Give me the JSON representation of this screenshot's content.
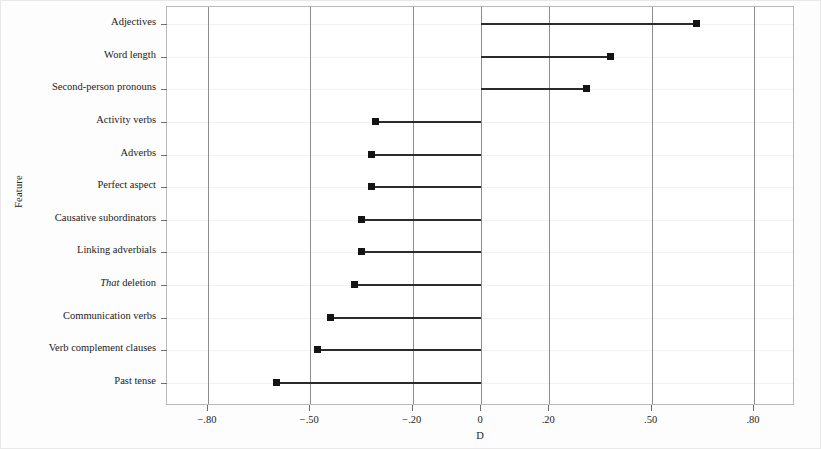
{
  "chart_data": {
    "type": "bar",
    "title": "",
    "subtitle": "",
    "xlabel": "D",
    "ylabel": "Feature",
    "orientation": "horizontal",
    "grid": true,
    "legend": null,
    "xlim": [
      -0.92,
      0.92
    ],
    "xticks": [
      -0.8,
      -0.5,
      -0.2,
      0,
      0.2,
      0.5,
      0.8
    ],
    "xticklabels": [
      "−.80",
      "−.50",
      "−.20",
      "0",
      ".20",
      ".50",
      ".80"
    ],
    "baseline": 0,
    "categories": [
      "Adjectives",
      "Word length",
      "Second-person pronouns",
      "Activity verbs",
      "Adverbs",
      "Perfect aspect",
      "Causative subordinators",
      "Linking adverbials",
      "That deletion",
      "Communication verbs",
      "Verb complement clauses",
      "Past tense"
    ],
    "values": [
      0.63,
      0.38,
      0.31,
      -0.31,
      -0.32,
      -0.32,
      -0.35,
      -0.35,
      -0.37,
      -0.44,
      -0.48,
      -0.6
    ],
    "points": [
      {
        "label": "Adjectives",
        "label_html": "Adjectives",
        "value": 0.63
      },
      {
        "label": "Word length",
        "label_html": "Word length",
        "value": 0.38
      },
      {
        "label": "Second-person pronouns",
        "label_html": "Second-person pronouns",
        "value": 0.31
      },
      {
        "label": "Activity verbs",
        "label_html": "Activity verbs",
        "value": -0.31
      },
      {
        "label": "Adverbs",
        "label_html": "Adverbs",
        "value": -0.32
      },
      {
        "label": "Perfect aspect",
        "label_html": "Perfect aspect",
        "value": -0.32
      },
      {
        "label": "Causative subordinators",
        "label_html": "Causative subordinators",
        "value": -0.35
      },
      {
        "label": "Linking adverbials",
        "label_html": "Linking adverbials",
        "value": -0.35
      },
      {
        "label": "That deletion",
        "label_html": "<i>That</i> deletion",
        "value": -0.37
      },
      {
        "label": "Communication verbs",
        "label_html": "Communication verbs",
        "value": -0.44
      },
      {
        "label": "Verb complement clauses",
        "label_html": "Verb complement clauses",
        "value": -0.48
      },
      {
        "label": "Past tense",
        "label_html": "Past tense",
        "value": -0.6
      }
    ],
    "colors": {
      "marker": "#141414",
      "line": "#2b2b2b",
      "gridline_major": "#8d8d8d",
      "gridline_minor": "#f1f1f1",
      "frame": "#b9b9b9",
      "background": "#ffffff"
    }
  }
}
